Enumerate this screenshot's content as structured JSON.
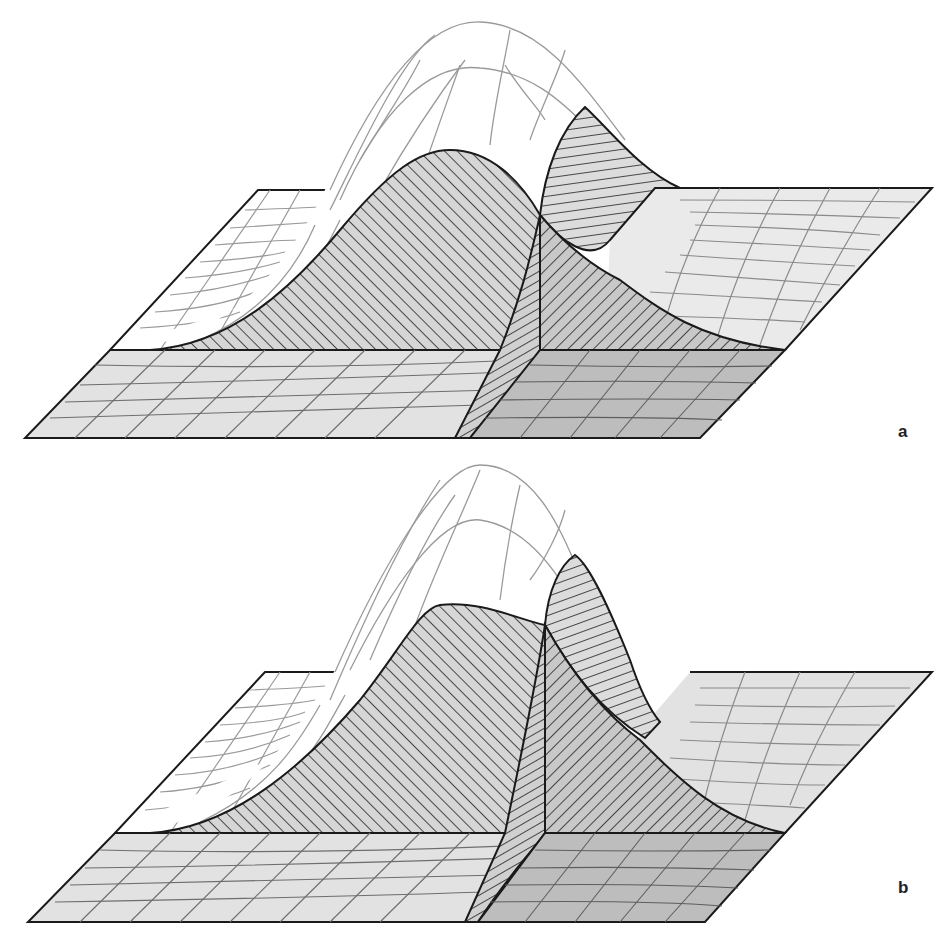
{
  "figure": {
    "panels": [
      {
        "id": "a",
        "label": "a"
      },
      {
        "id": "b",
        "label": "b"
      }
    ]
  },
  "colors": {
    "background": "#ffffff",
    "outline": "#1a1a1a",
    "grid_light": "#9a9a9a",
    "plane_light": "#e6e6e6",
    "plane_dark": "#bdbdbd",
    "hatch": "#222222",
    "hatch_fill": "#d4d4d4"
  }
}
